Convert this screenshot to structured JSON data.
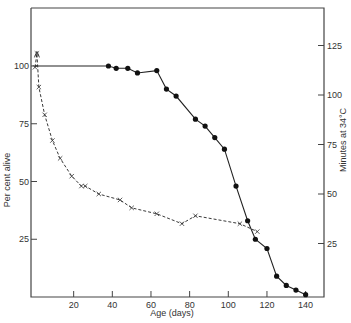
{
  "chart_data": {
    "type": "line",
    "title": "",
    "xlabel": "Age (days)",
    "ylabel_left": "Per cent alive",
    "ylabel_right": "Minutes at 34°C",
    "xlim": [
      0,
      150
    ],
    "ylim_left": [
      0,
      125
    ],
    "ylim_right": [
      0,
      140
    ],
    "x_ticks": [
      20,
      40,
      60,
      80,
      100,
      120,
      140
    ],
    "y_ticks_left": [
      25,
      50,
      75,
      100
    ],
    "y_ticks_right": [
      25,
      50,
      75,
      100,
      125
    ],
    "grid": false,
    "legend": null,
    "series": [
      {
        "name": "Per cent alive",
        "axis": "left",
        "marker": "filled-circle",
        "line": "solid",
        "x": [
          0,
          38,
          42,
          48,
          53,
          63,
          68,
          73,
          83,
          88,
          93,
          98,
          104,
          110,
          114,
          120,
          125,
          130,
          135,
          140
        ],
        "y": [
          100,
          100,
          99,
          99,
          97,
          98,
          90,
          87,
          77,
          74,
          69,
          64,
          48,
          33,
          25,
          21,
          9,
          5,
          3,
          1
        ]
      },
      {
        "name": "Minutes at 34°C",
        "axis": "right",
        "marker": "cross",
        "line": "dashed",
        "x": [
          0,
          1,
          2,
          5,
          9,
          13,
          19,
          24,
          26,
          33,
          44,
          50,
          63,
          76,
          83,
          106,
          115
        ],
        "y": [
          114,
          121,
          104,
          90,
          77,
          68,
          59,
          54,
          54,
          50,
          47,
          43,
          40,
          35,
          39,
          35,
          31
        ]
      }
    ]
  }
}
